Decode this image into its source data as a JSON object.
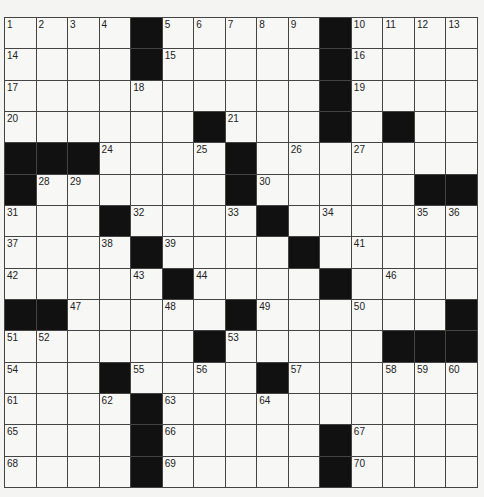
{
  "puzzle": {
    "rows": 15,
    "cols": 15,
    "colors": {
      "black": "#111111",
      "white": "#f7f7f5",
      "line": "#444444"
    },
    "grid": [
      "....#.....#....",
      "....#.....#....",
      "..........#....",
      "......#...#.#..",
      "###....#.......",
      "#......#.....##",
      "...#....#......",
      "....#....#.....",
      ".....#....#....",
      "##.....#......#",
      "......#.....###",
      "...#....#......",
      "....#..........",
      "....#.....#....",
      "....#.....#...."
    ],
    "numbers": [
      {
        "r": 0,
        "c": 0,
        "n": "1"
      },
      {
        "r": 0,
        "c": 1,
        "n": "2"
      },
      {
        "r": 0,
        "c": 2,
        "n": "3"
      },
      {
        "r": 0,
        "c": 3,
        "n": "4"
      },
      {
        "r": 0,
        "c": 5,
        "n": "5"
      },
      {
        "r": 0,
        "c": 6,
        "n": "6"
      },
      {
        "r": 0,
        "c": 7,
        "n": "7"
      },
      {
        "r": 0,
        "c": 8,
        "n": "8"
      },
      {
        "r": 0,
        "c": 9,
        "n": "9"
      },
      {
        "r": 0,
        "c": 11,
        "n": "10"
      },
      {
        "r": 0,
        "c": 12,
        "n": "11"
      },
      {
        "r": 0,
        "c": 13,
        "n": "12"
      },
      {
        "r": 0,
        "c": 14,
        "n": "13"
      },
      {
        "r": 1,
        "c": 0,
        "n": "14"
      },
      {
        "r": 1,
        "c": 5,
        "n": "15"
      },
      {
        "r": 1,
        "c": 11,
        "n": "16"
      },
      {
        "r": 2,
        "c": 0,
        "n": "17"
      },
      {
        "r": 2,
        "c": 4,
        "n": "18"
      },
      {
        "r": 2,
        "c": 11,
        "n": "19"
      },
      {
        "r": 3,
        "c": 0,
        "n": "20"
      },
      {
        "r": 3,
        "c": 7,
        "n": "21"
      },
      {
        "r": 3,
        "c": 10,
        "n": "22"
      },
      {
        "r": 3,
        "c": 12,
        "n": "23"
      },
      {
        "r": 4,
        "c": 3,
        "n": "24"
      },
      {
        "r": 4,
        "c": 6,
        "n": "25"
      },
      {
        "r": 4,
        "c": 9,
        "n": "26"
      },
      {
        "r": 4,
        "c": 11,
        "n": "27"
      },
      {
        "r": 5,
        "c": 1,
        "n": "28"
      },
      {
        "r": 5,
        "c": 2,
        "n": "29"
      },
      {
        "r": 5,
        "c": 8,
        "n": "30"
      },
      {
        "r": 6,
        "c": 0,
        "n": "31"
      },
      {
        "r": 6,
        "c": 4,
        "n": "32"
      },
      {
        "r": 6,
        "c": 7,
        "n": "33"
      },
      {
        "r": 6,
        "c": 10,
        "n": "34"
      },
      {
        "r": 6,
        "c": 13,
        "n": "35"
      },
      {
        "r": 6,
        "c": 14,
        "n": "36"
      },
      {
        "r": 7,
        "c": 0,
        "n": "37"
      },
      {
        "r": 7,
        "c": 3,
        "n": "38"
      },
      {
        "r": 7,
        "c": 5,
        "n": "39"
      },
      {
        "r": 7,
        "c": 9,
        "n": "40"
      },
      {
        "r": 7,
        "c": 11,
        "n": "41"
      },
      {
        "r": 8,
        "c": 0,
        "n": "42"
      },
      {
        "r": 8,
        "c": 4,
        "n": "43"
      },
      {
        "r": 8,
        "c": 6,
        "n": "44"
      },
      {
        "r": 8,
        "c": 10,
        "n": "45"
      },
      {
        "r": 8,
        "c": 12,
        "n": "46"
      },
      {
        "r": 9,
        "c": 2,
        "n": "47"
      },
      {
        "r": 9,
        "c": 5,
        "n": "48"
      },
      {
        "r": 9,
        "c": 8,
        "n": "49"
      },
      {
        "r": 9,
        "c": 11,
        "n": "50"
      },
      {
        "r": 10,
        "c": 0,
        "n": "51"
      },
      {
        "r": 10,
        "c": 1,
        "n": "52"
      },
      {
        "r": 10,
        "c": 7,
        "n": "53"
      },
      {
        "r": 11,
        "c": 0,
        "n": "54"
      },
      {
        "r": 11,
        "c": 4,
        "n": "55"
      },
      {
        "r": 11,
        "c": 6,
        "n": "56"
      },
      {
        "r": 11,
        "c": 9,
        "n": "57"
      },
      {
        "r": 11,
        "c": 12,
        "n": "58"
      },
      {
        "r": 11,
        "c": 13,
        "n": "59"
      },
      {
        "r": 11,
        "c": 14,
        "n": "60"
      },
      {
        "r": 12,
        "c": 0,
        "n": "61"
      },
      {
        "r": 12,
        "c": 3,
        "n": "62"
      },
      {
        "r": 12,
        "c": 5,
        "n": "63"
      },
      {
        "r": 12,
        "c": 8,
        "n": "64"
      },
      {
        "r": 13,
        "c": 0,
        "n": "65"
      },
      {
        "r": 13,
        "c": 5,
        "n": "66"
      },
      {
        "r": 13,
        "c": 11,
        "n": "67"
      },
      {
        "r": 14,
        "c": 0,
        "n": "68"
      },
      {
        "r": 14,
        "c": 5,
        "n": "69"
      },
      {
        "r": 14,
        "c": 11,
        "n": "70"
      }
    ]
  }
}
